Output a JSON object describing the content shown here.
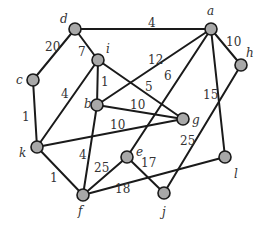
{
  "diagram": {
    "type": "weighted-undirected-graph",
    "nodes": [
      {
        "id": "a",
        "label": "a",
        "x": 211,
        "y": 29,
        "lx": 207,
        "ly": 15
      },
      {
        "id": "b",
        "label": "b",
        "x": 97,
        "y": 105,
        "lx": 84,
        "ly": 108
      },
      {
        "id": "c",
        "label": "c",
        "x": 33,
        "y": 80,
        "lx": 16,
        "ly": 84
      },
      {
        "id": "d",
        "label": "d",
        "x": 75,
        "y": 29,
        "lx": 60,
        "ly": 23
      },
      {
        "id": "e",
        "label": "e",
        "x": 127,
        "y": 157,
        "lx": 136,
        "ly": 156
      },
      {
        "id": "f",
        "label": "f",
        "x": 83,
        "y": 195,
        "lx": 78,
        "ly": 215
      },
      {
        "id": "g",
        "label": "g",
        "x": 183,
        "y": 119,
        "lx": 192,
        "ly": 124
      },
      {
        "id": "h",
        "label": "h",
        "x": 241,
        "y": 65,
        "lx": 246,
        "ly": 57
      },
      {
        "id": "i",
        "label": "i",
        "x": 98,
        "y": 60,
        "lx": 106,
        "ly": 53
      },
      {
        "id": "j",
        "label": "j",
        "x": 164,
        "y": 193,
        "lx": 162,
        "ly": 216
      },
      {
        "id": "k",
        "label": "k",
        "x": 37,
        "y": 147,
        "lx": 19,
        "ly": 157
      },
      {
        "id": "l",
        "label": "l",
        "x": 225,
        "y": 157,
        "lx": 234,
        "ly": 178
      }
    ],
    "edges": [
      {
        "from": "d",
        "to": "a",
        "weight": "4",
        "wx": 148,
        "wy": 27
      },
      {
        "from": "d",
        "to": "c",
        "weight": "20",
        "wx": 45,
        "wy": 51
      },
      {
        "from": "d",
        "to": "i",
        "weight": "7",
        "wx": 78,
        "wy": 56
      },
      {
        "from": "c",
        "to": "k",
        "weight": "1",
        "wx": 22,
        "wy": 121
      },
      {
        "from": "i",
        "to": "b",
        "weight": "1",
        "wx": 101,
        "wy": 86
      },
      {
        "from": "i",
        "to": "k",
        "weight": "4",
        "wx": 61,
        "wy": 98
      },
      {
        "from": "i",
        "to": "g",
        "weight": "5",
        "wx": 145,
        "wy": 91
      },
      {
        "from": "a",
        "to": "b",
        "weight": "12",
        "wx": 148,
        "wy": 64
      },
      {
        "from": "a",
        "to": "e",
        "weight": "6",
        "wx": 164,
        "wy": 80
      },
      {
        "from": "a",
        "to": "h",
        "weight": "10",
        "wx": 226,
        "wy": 46
      },
      {
        "from": "a",
        "to": "l",
        "weight": "15",
        "wx": 203,
        "wy": 99
      },
      {
        "from": "b",
        "to": "g",
        "weight": "10",
        "wx": 130,
        "wy": 109
      },
      {
        "from": "k",
        "to": "g",
        "weight": "10",
        "wx": 110,
        "wy": 129
      },
      {
        "from": "b",
        "to": "f",
        "weight": "4",
        "wx": 79,
        "wy": 159
      },
      {
        "from": "k",
        "to": "f",
        "weight": "1",
        "wx": 50,
        "wy": 182
      },
      {
        "from": "f",
        "to": "e",
        "weight": "25",
        "wx": 94,
        "wy": 172
      },
      {
        "from": "e",
        "to": "j",
        "weight": "17",
        "wx": 141,
        "wy": 167
      },
      {
        "from": "f",
        "to": "l",
        "weight": "18",
        "wx": 115,
        "wy": 193
      },
      {
        "from": "h",
        "to": "j",
        "weight": "25",
        "wx": 180,
        "wy": 145
      }
    ]
  }
}
